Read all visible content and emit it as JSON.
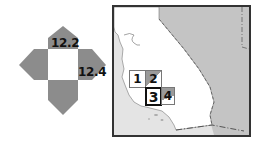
{
  "compass": {
    "top_label": "12.2",
    "right_label": "12.4",
    "arrow_color": "#8c8c8c",
    "center_color": "#ffffff"
  },
  "map": {
    "region": "California",
    "land_color": "#ffffff",
    "ocean_color": "#e4e4e4",
    "neighbor_color": "#c4c4c4",
    "grid_cells": [
      {
        "label": "1",
        "fill": "#ffffff"
      },
      {
        "label": "2",
        "fill": "#9a9a9a"
      },
      {
        "label": "3",
        "fill": "#ffffff",
        "highlighted": true
      },
      {
        "label": "4",
        "fill": "#9a9a9a"
      }
    ]
  }
}
